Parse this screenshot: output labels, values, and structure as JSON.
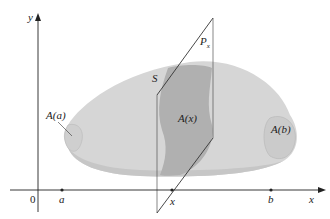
{
  "diagram": {
    "type": "solid-of-volume-cross-section",
    "axes": {
      "y_label": "y",
      "x_label": "x",
      "origin_label": "0"
    },
    "ticks": {
      "a": "a",
      "x": "x",
      "b": "b"
    },
    "labels": {
      "solid": "S",
      "plane": "P",
      "plane_sub": "x",
      "area_a": "A(a)",
      "area_x": "A(x)",
      "area_b": "A(b)"
    },
    "colors": {
      "solid_fill": "#d4d4d4",
      "solid_dark": "#bdbdbd",
      "cross_section": "#a9a9a9",
      "axis": "#222222",
      "background": "#ffffff"
    }
  }
}
